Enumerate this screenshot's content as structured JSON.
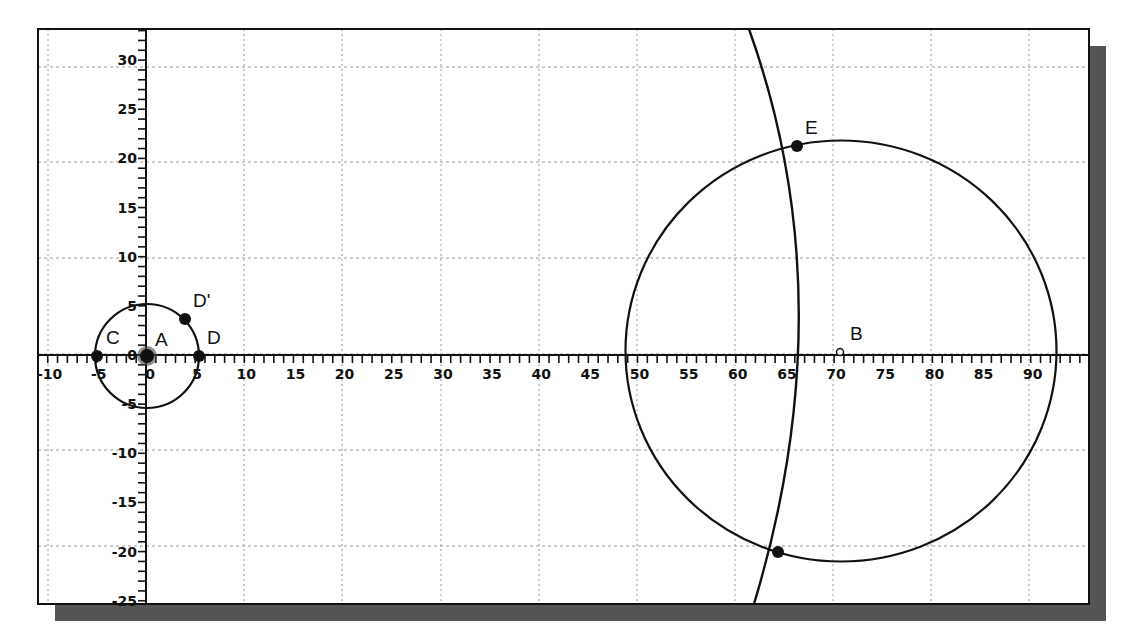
{
  "canvas": {
    "width": 1126,
    "height": 640
  },
  "frame": {
    "x": 38,
    "y": 29,
    "width": 1051,
    "height": 575,
    "shadow_offset": 17,
    "shadow_color": "#555555",
    "border_color": "#111111"
  },
  "axes": {
    "origin_px": [
      146,
      355
    ],
    "px_per_unit_x": 9.83,
    "px_per_unit_y": 9.83,
    "x_ticks": [
      -10,
      -5,
      0,
      5,
      10,
      15,
      20,
      25,
      30,
      35,
      40,
      45,
      50,
      55,
      60,
      65,
      70,
      75,
      80,
      85,
      90
    ],
    "y_ticks": [
      30,
      25,
      20,
      15,
      10,
      5,
      0,
      -5,
      -10,
      -15,
      -20,
      -25
    ],
    "x_range": [
      -11,
      96
    ],
    "y_range": [
      -25.6,
      33
    ],
    "minor_tick_step": 1
  },
  "grid": {
    "vertical_px": [
      48,
      146,
      244,
      342,
      441,
      539,
      637,
      735,
      833,
      931,
      1029
    ],
    "horizontal_px": [
      67,
      162,
      258,
      354,
      450,
      546
    ],
    "color": "#9a9a9a"
  },
  "points": [
    {
      "id": "A",
      "label": "A",
      "px": [
        147,
        356
      ],
      "style": "large-dot",
      "label_offset": [
        8,
        -10
      ]
    },
    {
      "id": "C",
      "label": "C",
      "px": [
        97,
        356
      ],
      "style": "dot",
      "label_offset": [
        9,
        -12
      ]
    },
    {
      "id": "D",
      "label": "D",
      "px": [
        199,
        356
      ],
      "style": "dot",
      "label_offset": [
        8,
        -12
      ]
    },
    {
      "id": "Dprime",
      "label": "D'",
      "px": [
        185,
        319
      ],
      "style": "dot",
      "label_offset": [
        8,
        -12
      ]
    },
    {
      "id": "B",
      "label": "B",
      "px": [
        840,
        352
      ],
      "style": "hollow",
      "label_offset": [
        10,
        -12
      ]
    },
    {
      "id": "E",
      "label": "E",
      "px": [
        797,
        146
      ],
      "style": "dot",
      "label_offset": [
        8,
        -12
      ]
    },
    {
      "id": "F",
      "label": "",
      "px": [
        778,
        552
      ],
      "style": "dot",
      "label_offset": [
        0,
        0
      ]
    }
  ],
  "circles": [
    {
      "id": "circle-A",
      "center_px": [
        147,
        356
      ],
      "r_px": 52
    },
    {
      "id": "circle-B",
      "center_px": [
        841,
        351
      ],
      "rx_px": 215.5,
      "ry_px": 210.5
    }
  ],
  "arcs": [
    {
      "id": "arc-through-E",
      "path": "M 749 29 Q 846 300 754 604"
    }
  ],
  "chart_data": {
    "type": "scatter",
    "title": "",
    "xlabel": "",
    "ylabel": "",
    "xlim": [
      -11,
      96
    ],
    "ylim": [
      -25.6,
      33
    ],
    "grid": true,
    "points": [
      {
        "label": "A",
        "x": 0,
        "y": 0
      },
      {
        "label": "C",
        "x": -5,
        "y": 0
      },
      {
        "label": "D",
        "x": 5.4,
        "y": 0
      },
      {
        "label": "D'",
        "x": 4,
        "y": 3.7
      },
      {
        "label": "B",
        "x": 70.6,
        "y": 0.3
      },
      {
        "label": "E",
        "x": 66.2,
        "y": 21.2
      },
      {
        "label": "",
        "x": 64.3,
        "y": -20.1
      }
    ],
    "shapes": [
      {
        "type": "circle",
        "center": "A",
        "radius": 5.3
      },
      {
        "type": "circle",
        "center": "B",
        "radius": 21.9
      },
      {
        "type": "arc",
        "through": [
          "E"
        ],
        "note": "large arc crossing x-axis near x=68"
      }
    ]
  }
}
